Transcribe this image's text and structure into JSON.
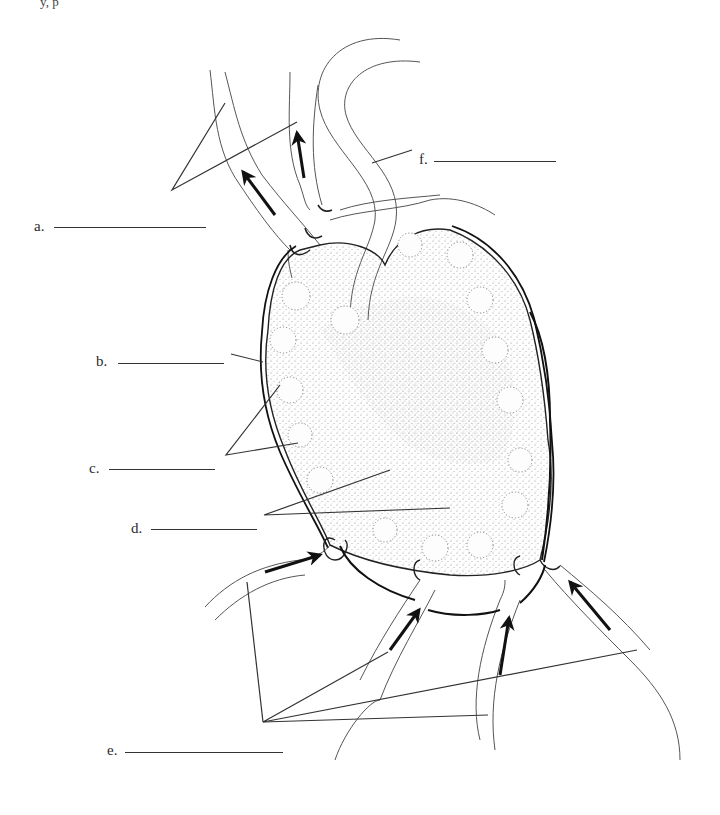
{
  "diagram": {
    "top_fragment": "y, p",
    "labels": [
      {
        "id": "a",
        "text": "a.",
        "x": 34,
        "y": 218,
        "blank_x1": 54,
        "blank_x2": 206,
        "blank_y": 227,
        "leader_points": "172,190 225,103 172,190 297,122"
      },
      {
        "id": "b",
        "text": "b.",
        "x": 96,
        "y": 353,
        "blank_x1": 118,
        "blank_x2": 224,
        "blank_y": 363,
        "leader_points": "231,354 263,362"
      },
      {
        "id": "c",
        "text": "c.",
        "x": 89,
        "y": 460,
        "blank_x1": 109,
        "blank_x2": 215,
        "blank_y": 469,
        "leader_points": "280,385 226,455 226,455 298,443"
      },
      {
        "id": "d",
        "text": "d.",
        "x": 131,
        "y": 520,
        "blank_x1": 151,
        "blank_x2": 257,
        "blank_y": 529,
        "leader_points": "390,470 264,515 264,515 450,508"
      },
      {
        "id": "e",
        "text": "e.",
        "x": 107,
        "y": 742,
        "blank_x1": 125,
        "blank_x2": 283,
        "blank_y": 752,
        "leader_points": "247,582 263,722 263,722 388,652 263,722 637,650 263,722 488,715"
      },
      {
        "id": "f",
        "text": "f.",
        "x": 419,
        "y": 151,
        "blank_x1": 434,
        "blank_x2": 556,
        "blank_y": 161,
        "leader_points": "372,163 412,150"
      }
    ],
    "answer_lines_count": 6,
    "colors": {
      "ink": "#222222",
      "stipple": "#7a7a7a",
      "background": "#ffffff",
      "arrow": "#111111"
    }
  }
}
